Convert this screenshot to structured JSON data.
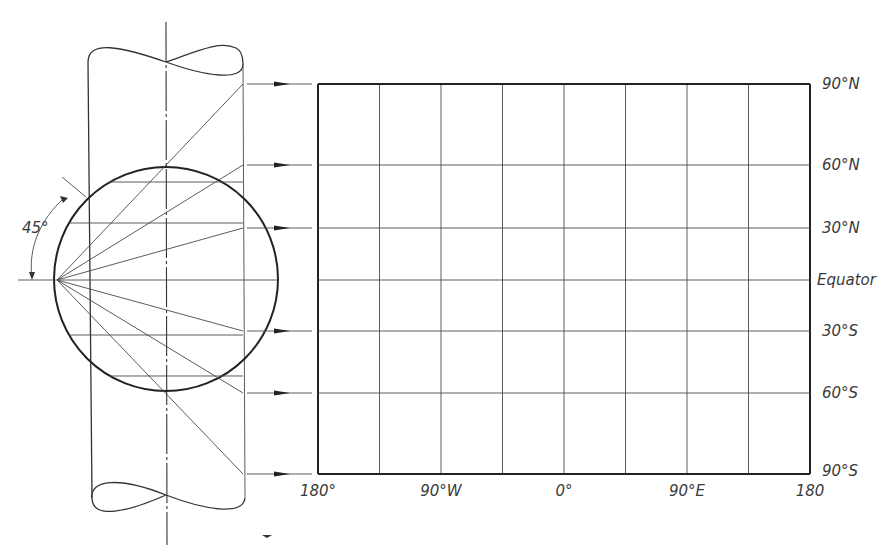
{
  "figure": {
    "type": "cylindrical-projection-construction",
    "angle_label": "45°",
    "ray_angles_deg": [
      60,
      45,
      30,
      0,
      -30,
      -45,
      -60
    ],
    "parallels": [
      {
        "lat": 90,
        "label": "90°N"
      },
      {
        "lat": 60,
        "label": "60°N"
      },
      {
        "lat": 30,
        "label": "30°N"
      },
      {
        "lat": 0,
        "label": "Equator"
      },
      {
        "lat": -30,
        "label": "30°S"
      },
      {
        "lat": -60,
        "label": "60°S"
      },
      {
        "lat": -90,
        "label": "90°S"
      }
    ],
    "meridians": [
      {
        "lon": -180,
        "label": "180°"
      },
      {
        "lon": -135,
        "label": ""
      },
      {
        "lon": -90,
        "label": "90°W"
      },
      {
        "lon": -45,
        "label": ""
      },
      {
        "lon": 0,
        "label": "0°"
      },
      {
        "lon": 45,
        "label": ""
      },
      {
        "lon": 90,
        "label": "90°E"
      },
      {
        "lon": 135,
        "label": ""
      },
      {
        "lon": 180,
        "label": "180"
      }
    ]
  }
}
